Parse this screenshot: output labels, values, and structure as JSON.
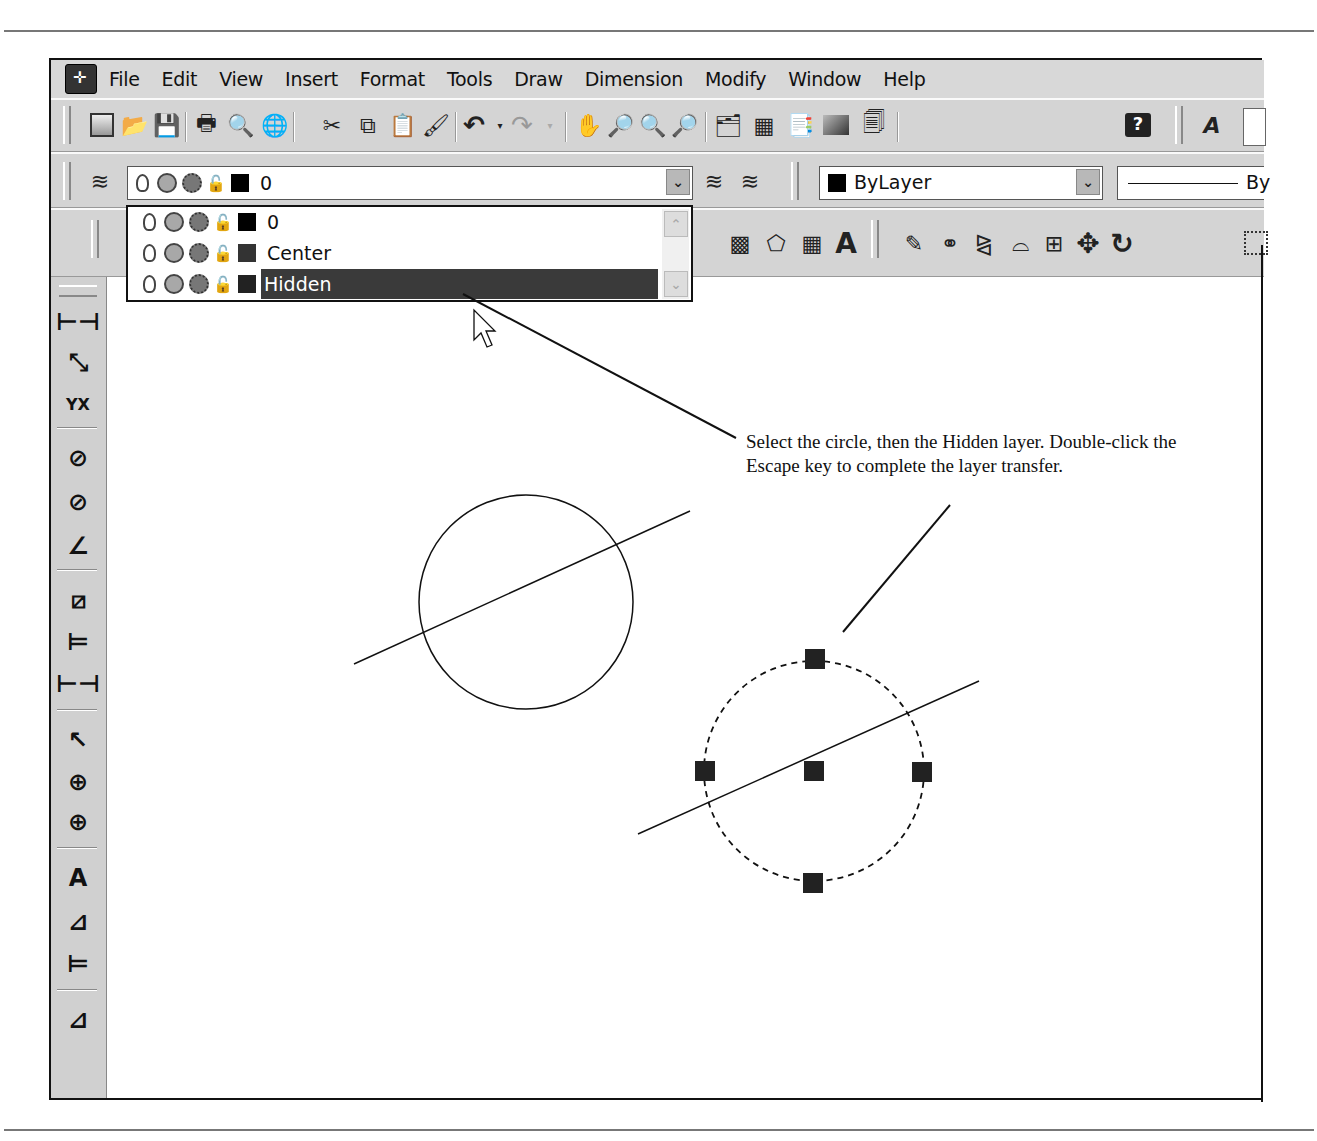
{
  "menubar": {
    "items": [
      "File",
      "Edit",
      "View",
      "Insert",
      "Format",
      "Tools",
      "Draw",
      "Dimension",
      "Modify",
      "Window",
      "Help"
    ]
  },
  "standard_toolbar": {
    "icons": [
      "new-icon",
      "open-icon",
      "save-icon",
      "plot-icon",
      "plot-preview-icon",
      "publish-icon",
      "cut-icon",
      "copy-icon",
      "paste-icon",
      "match-properties-icon",
      "undo-icon",
      "undo-dropdown-icon",
      "redo-icon",
      "redo-dropdown-icon",
      "pan-icon",
      "zoom-realtime-icon",
      "zoom-window-icon",
      "zoom-previous-icon",
      "properties-icon",
      "design-center-icon",
      "tool-palettes-icon",
      "sheet-set-icon",
      "markup-icon",
      "help-icon",
      "text-style-icon"
    ]
  },
  "layers_toolbar": {
    "current_layer": "0",
    "layer_dropdown": {
      "items": [
        {
          "name": "0",
          "color": "#000000",
          "selected": false
        },
        {
          "name": "Center",
          "color": "#333333",
          "selected": false
        },
        {
          "name": "Hidden",
          "color": "#222222",
          "selected": true
        }
      ]
    }
  },
  "properties_toolbar": {
    "color_value": "ByLayer",
    "linetype_value": "By"
  },
  "modify_toolbar": {
    "icons": [
      "erase-icon",
      "copy-object-icon",
      "mirror-icon",
      "offset-icon",
      "array-icon",
      "move-icon",
      "rotate-icon",
      "scale-icon"
    ]
  },
  "draw_toolbar_partial": {
    "icons": [
      "hatch-icon",
      "region-icon",
      "table-icon",
      "multiline-text-icon"
    ],
    "text_glyph": "A"
  },
  "dimension_toolbar": {
    "icons": [
      "linear-dim-icon",
      "aligned-dim-icon",
      "ordinate-dim-icon",
      "radius-dim-icon",
      "diameter-dim-icon",
      "angular-dim-icon",
      "quick-dim-icon",
      "baseline-dim-icon",
      "continue-dim-icon",
      "leader-icon",
      "tolerance-icon",
      "center-mark-icon",
      "dim-edit-icon",
      "dim-text-edit-icon",
      "dim-update-icon",
      "dim-style-icon"
    ]
  },
  "callout": {
    "text": "Select the circle, then the Hidden layer. Double-click the Escape key to complete the layer transfer."
  },
  "drawing": {
    "circle1": {
      "cx": 526,
      "cy": 602,
      "r": 107,
      "style": "continuous"
    },
    "circle2": {
      "cx": 814,
      "cy": 771,
      "r": 110,
      "style": "hidden-dashed",
      "grips": 5
    }
  }
}
